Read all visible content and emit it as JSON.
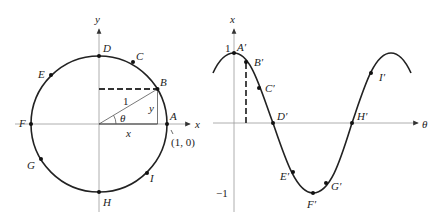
{
  "left_figure": {
    "axis_x_label": "x",
    "axis_y_label": "y",
    "points": [
      {
        "id": "A",
        "label": "A"
      },
      {
        "id": "B",
        "label": "B"
      },
      {
        "id": "C",
        "label": "C"
      },
      {
        "id": "D",
        "label": "D"
      },
      {
        "id": "E",
        "label": "E"
      },
      {
        "id": "F",
        "label": "F"
      },
      {
        "id": "G",
        "label": "G"
      },
      {
        "id": "H",
        "label": "H"
      },
      {
        "id": "I",
        "label": "I"
      }
    ],
    "radius_label": "1",
    "angle_label": "θ",
    "leg_x_label": "x",
    "leg_y_label": "y",
    "coord_label": "(1, 0)"
  },
  "right_figure": {
    "axis_x_label": "θ",
    "axis_y_label": "x",
    "tick_pos": "1",
    "tick_neg": "−1",
    "points": [
      {
        "id": "A",
        "label": "A′"
      },
      {
        "id": "B",
        "label": "B′"
      },
      {
        "id": "C",
        "label": "C′"
      },
      {
        "id": "D",
        "label": "D′"
      },
      {
        "id": "E",
        "label": "E′"
      },
      {
        "id": "F",
        "label": "F′"
      },
      {
        "id": "G",
        "label": "G′"
      },
      {
        "id": "H",
        "label": "H′"
      },
      {
        "id": "I",
        "label": "I′"
      }
    ]
  }
}
